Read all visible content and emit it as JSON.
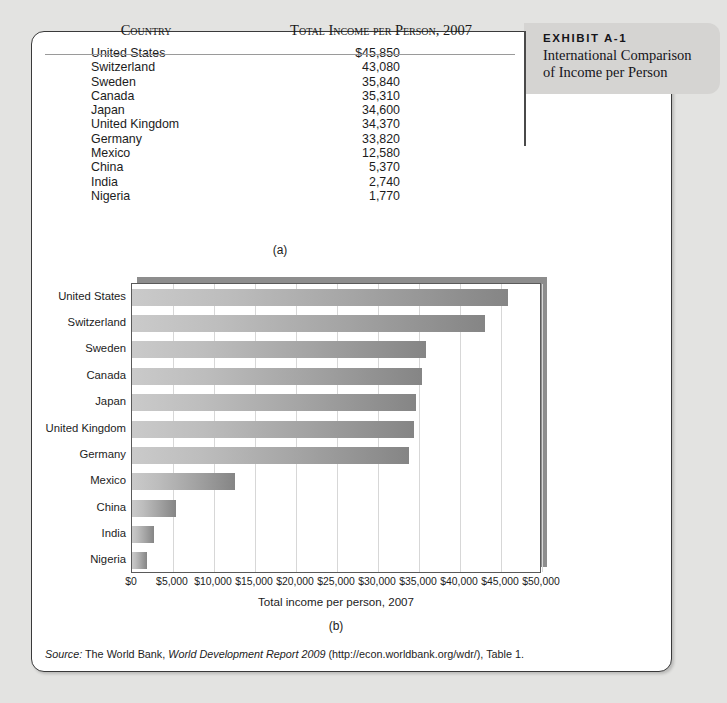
{
  "exhibit": {
    "label": "EXHIBIT A-1",
    "title_line1": "International Comparison",
    "title_line2": "of Income per Person"
  },
  "table": {
    "headers": {
      "country": "Country",
      "income": "Total Income per Person, 2007"
    },
    "rows": [
      {
        "country": "United States",
        "income": "$45,850"
      },
      {
        "country": "Switzerland",
        "income": "43,080"
      },
      {
        "country": "Sweden",
        "income": "35,840"
      },
      {
        "country": "Canada",
        "income": "35,310"
      },
      {
        "country": "Japan",
        "income": "34,600"
      },
      {
        "country": "United Kingdom",
        "income": "34,370"
      },
      {
        "country": "Germany",
        "income": "33,820"
      },
      {
        "country": "Mexico",
        "income": "12,580"
      },
      {
        "country": "China",
        "income": "5,370"
      },
      {
        "country": "India",
        "income": "2,740"
      },
      {
        "country": "Nigeria",
        "income": "1,770"
      }
    ],
    "panel_label": "(a)"
  },
  "chart_panel_label": "(b)",
  "source": {
    "prefix": "Source:",
    "text_1": " The World Bank, ",
    "italic": "World Development Report 2009",
    "text_2": " (http://econ.worldbank.org/wdr/), Table 1."
  },
  "colors": {
    "page_background": "#e3e3e1",
    "card_background": "#ffffff",
    "card_border": "#3a3a3a",
    "tab_background": "#d5d4d2",
    "bar_light": "#cacaca",
    "bar_dark": "#858585",
    "gridline": "#d7d7d7",
    "shadow_slab": "#8d8d8d"
  },
  "chart_data": {
    "type": "bar",
    "orientation": "horizontal",
    "title": "",
    "xlabel": "Total income per person, 2007",
    "ylabel": "",
    "categories": [
      "United States",
      "Switzerland",
      "Sweden",
      "Canada",
      "Japan",
      "United Kingdom",
      "Germany",
      "Mexico",
      "China",
      "India",
      "Nigeria"
    ],
    "values": [
      45850,
      43080,
      35840,
      35310,
      34600,
      34370,
      33820,
      12580,
      5370,
      2740,
      1770
    ],
    "xlim": [
      0,
      50000
    ],
    "xticks": [
      0,
      5000,
      10000,
      15000,
      20000,
      25000,
      30000,
      35000,
      40000,
      45000,
      50000
    ],
    "xtick_labels": [
      "$0",
      "$5,000",
      "$10,000",
      "$15,000",
      "$20,000",
      "$25,000",
      "$30,000",
      "$35,000",
      "$40,000",
      "$45,000",
      "$50,000"
    ],
    "grid": "vertical",
    "legend": "none"
  }
}
